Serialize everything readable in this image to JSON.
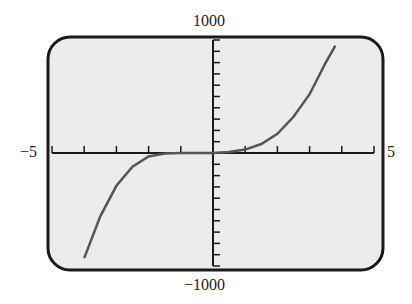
{
  "chart_data": {
    "type": "line",
    "title": "",
    "xlabel": "",
    "ylabel": "",
    "xlim": [
      -5,
      5
    ],
    "ylim": [
      -1000,
      1000
    ],
    "x_tick_step": 1,
    "y_tick_step": 100,
    "grid": false,
    "labels": {
      "xmin": "−5",
      "xmax": "5",
      "ymax": "1000",
      "ymin": "−1000"
    },
    "series": [
      {
        "name": "f(x)",
        "x": [
          -4.0,
          -3.5,
          -3.0,
          -2.5,
          -2.0,
          -1.5,
          -1.0,
          -0.5,
          0.0,
          0.5,
          1.0,
          1.5,
          2.0,
          2.5,
          3.0,
          3.5,
          3.8
        ],
        "y": [
          -930,
          -560,
          -290,
          -120,
          -30,
          -5,
          0,
          0,
          0,
          8,
          30,
          80,
          170,
          320,
          520,
          800,
          950
        ]
      }
    ]
  },
  "colors": {
    "frame": "#1a1a1a",
    "plot_bg": "#ececec",
    "curve": "#555555",
    "axis": "#1a1a1a"
  }
}
